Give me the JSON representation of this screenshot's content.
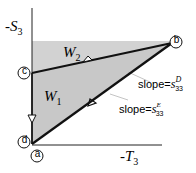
{
  "diagram": {
    "axes": {
      "y_label_prefix": "-S",
      "y_label_sub": "3",
      "x_label_prefix": "-T",
      "x_label_sub": "3"
    },
    "points": [
      {
        "id": "a",
        "label": "a"
      },
      {
        "id": "b",
        "label": "b"
      },
      {
        "id": "c",
        "label": "c"
      },
      {
        "id": "d",
        "label": "d"
      }
    ],
    "regions": {
      "w1": {
        "label": "W",
        "sub": "1"
      },
      "w2": {
        "label": "W",
        "sub": "2"
      }
    },
    "slopes": {
      "upper": {
        "prefix": "slope=",
        "symbol": "s",
        "sup": "D",
        "sub": "33"
      },
      "lower": {
        "prefix": "slope=",
        "symbol": "s",
        "sup": "E",
        "sub": "33"
      }
    },
    "colors": {
      "shade": "#cccccc",
      "line": "#111111",
      "leader": "#bbbbbb"
    }
  }
}
